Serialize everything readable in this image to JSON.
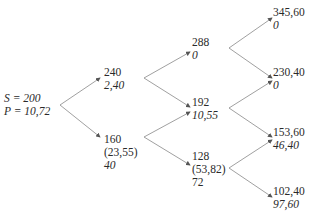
{
  "diagram": {
    "type": "binomial-tree",
    "root": {
      "line1": "S = 200",
      "line2": "P = 10,72"
    },
    "step1": {
      "up": {
        "price": "240",
        "value": "2,40"
      },
      "down": {
        "price": "160",
        "exercise": "(23,55)",
        "value": "40"
      }
    },
    "step2": {
      "uu": {
        "price": "288",
        "value": "0"
      },
      "ud": {
        "price": "192",
        "value": "10,55"
      },
      "dd": {
        "price": "128",
        "exercise": "(53,82)",
        "value": "72"
      }
    },
    "step3": {
      "uuu": {
        "price": "345,60",
        "value": "0"
      },
      "uud": {
        "price": "230,40",
        "value": "0"
      },
      "udd": {
        "price": "153,60",
        "value": "46,40"
      },
      "ddd": {
        "price": "102,40",
        "value": "97,60"
      }
    },
    "colors": {
      "line": "#777777",
      "text": "#2a2a2a"
    }
  }
}
